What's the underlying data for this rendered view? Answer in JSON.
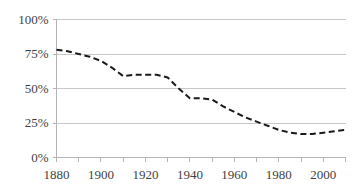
{
  "chart_data": {
    "type": "line",
    "title": "",
    "subtitle": "",
    "xlabel": "",
    "ylabel": "",
    "xlim": [
      1880,
      2010
    ],
    "ylim": [
      0,
      100
    ],
    "grid": "horizontal",
    "legend": "none",
    "line_style": "dashed",
    "line_color": "#1a1a1a",
    "grid_color": "#c8c8c8",
    "axis_color": "#b4b4b4",
    "y_tick_labels": [
      "0%",
      "25%",
      "50%",
      "75%",
      "100%"
    ],
    "y_tick_values": [
      0,
      25,
      50,
      75,
      100
    ],
    "x_tick_labels": [
      "1880",
      "1900",
      "1920",
      "1940",
      "1960",
      "1980",
      "2000"
    ],
    "x_tick_values": [
      1880,
      1900,
      1920,
      1940,
      1960,
      1980,
      2000
    ],
    "x_minor_step": 10,
    "x": [
      1880,
      1885,
      1890,
      1895,
      1900,
      1905,
      1910,
      1915,
      1920,
      1925,
      1930,
      1935,
      1940,
      1945,
      1950,
      1955,
      1960,
      1965,
      1970,
      1975,
      1980,
      1985,
      1990,
      1995,
      2000,
      2005,
      2010
    ],
    "values": [
      78,
      77,
      75,
      73,
      70,
      65,
      59,
      60,
      60,
      60,
      58,
      50,
      43,
      43,
      42,
      37,
      33,
      29,
      26,
      23,
      20,
      18,
      17,
      17,
      18,
      19,
      20
    ]
  }
}
